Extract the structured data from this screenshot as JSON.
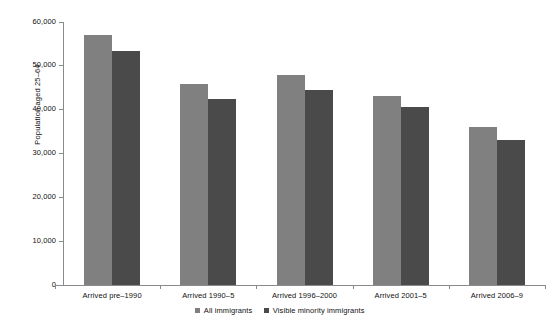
{
  "chart_data": {
    "type": "bar",
    "title": "",
    "xlabel": "",
    "ylabel": "Population aged 25–64",
    "categories": [
      "Arrived pre–1990",
      "Arrived 1990–5",
      "Arrived 1996–2000",
      "Arrived 2001–5",
      "Arrived 2006–9"
    ],
    "series": [
      {
        "name": "All immigrants",
        "color": "#808080",
        "values": [
          57000,
          45900,
          48000,
          43200,
          36100
        ]
      },
      {
        "name": "Visible minority immigrants",
        "color": "#4a4a4a",
        "values": [
          53400,
          42500,
          44500,
          40600,
          33100
        ]
      }
    ],
    "ylim": [
      0,
      60000
    ],
    "yticks": [
      0,
      10000,
      20000,
      30000,
      40000,
      50000,
      60000
    ],
    "ytick_labels": [
      "0",
      "10,000",
      "20,000",
      "30,000",
      "40,000",
      "50,000",
      "60,000"
    ],
    "grid": false,
    "legend_position": "bottom"
  },
  "legend": {
    "items": [
      {
        "label": "All immigrants"
      },
      {
        "label": "Visible minority immigrants"
      }
    ]
  }
}
